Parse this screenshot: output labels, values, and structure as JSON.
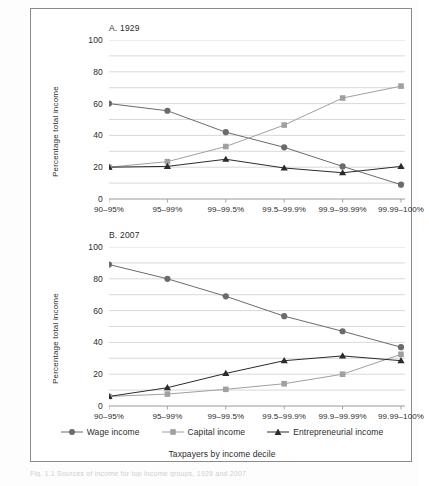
{
  "figure": {
    "ylabel": "Percentage total income",
    "xaxis_title": "Taxpayers by income decile",
    "caption": "Fig. 1.1  Sources of income for top income groups, 1929 and 2007",
    "colors": {
      "wage": "#6b6b6b",
      "capital": "#a0a0a0",
      "entrepreneurial": "#2b2b2b",
      "grid": "#c9c9c9",
      "axis": "#9a9a9a",
      "frame": "#8a8a8a",
      "background": "#ffffff"
    }
  },
  "legend": {
    "position": "bottom-center",
    "items": [
      {
        "label": "Wage income",
        "marker": "circle",
        "color": "#6b6b6b"
      },
      {
        "label": "Capital income",
        "marker": "square",
        "color": "#a0a0a0"
      },
      {
        "label": "Entrepreneurial income",
        "marker": "triangle",
        "color": "#2b2b2b"
      }
    ]
  },
  "yticks": [
    "100",
    "80",
    "60",
    "40",
    "20",
    "0"
  ],
  "chart_data": [
    {
      "type": "line",
      "title": "A. 1929",
      "xlabel": "Taxpayers by income decile",
      "ylabel": "Percentage total income",
      "ylim": [
        0,
        100
      ],
      "ytick_values": [
        0,
        20,
        40,
        60,
        80,
        100
      ],
      "minor_gridlines": [
        10,
        30,
        50,
        70,
        90
      ],
      "grid": true,
      "legend_position": "bottom-center",
      "categories": [
        "90–95%",
        "95–99%",
        "99–99.5%",
        "99.5–99.9%",
        "99.9–99.99%",
        "99.99–100%"
      ],
      "series": [
        {
          "name": "Wage income",
          "marker": "circle",
          "color": "#6b6b6b",
          "values": [
            60,
            55.5,
            42,
            32.5,
            20.5,
            9
          ]
        },
        {
          "name": "Capital income",
          "marker": "square",
          "color": "#a0a0a0",
          "values": [
            20,
            23.5,
            33,
            46.5,
            63.5,
            71
          ]
        },
        {
          "name": "Entrepreneurial income",
          "marker": "triangle",
          "color": "#2b2b2b",
          "values": [
            20,
            20.5,
            25,
            19.5,
            16.5,
            20.5
          ]
        }
      ]
    },
    {
      "type": "line",
      "title": "B. 2007",
      "xlabel": "Taxpayers by income decile",
      "ylabel": "Percentage total income",
      "ylim": [
        0,
        100
      ],
      "ytick_values": [
        0,
        20,
        40,
        60,
        80,
        100
      ],
      "minor_gridlines": [
        10,
        30,
        50,
        70,
        90
      ],
      "grid": true,
      "legend_position": "bottom-center",
      "categories": [
        "90–95%",
        "95–99%",
        "99–99.5%",
        "99.5–99.9%",
        "99.9–99.99%",
        "99.99–100%"
      ],
      "series": [
        {
          "name": "Wage income",
          "marker": "circle",
          "color": "#6b6b6b",
          "values": [
            89,
            80,
            69,
            56.5,
            47,
            37
          ]
        },
        {
          "name": "Capital income",
          "marker": "square",
          "color": "#a0a0a0",
          "values": [
            6,
            7.5,
            10.5,
            14,
            20,
            32.5
          ]
        },
        {
          "name": "Entrepreneurial income",
          "marker": "triangle",
          "color": "#2b2b2b",
          "values": [
            6,
            11.5,
            20.5,
            28.5,
            31.5,
            28.5
          ]
        }
      ]
    }
  ]
}
